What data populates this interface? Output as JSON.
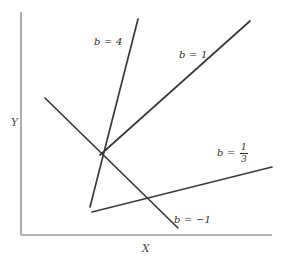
{
  "figure": {
    "background_color": "#ffffff",
    "line_color": "#3a3a3a",
    "axis_color": "#9a9a9a"
  },
  "axes": {
    "y_label": "Y",
    "x_label": "X",
    "y_axis": {
      "x": 21,
      "y_top": 12,
      "y_bottom": 235
    },
    "x_axis": {
      "y": 235,
      "x_left": 21,
      "x_right": 272
    }
  },
  "chart_data": {
    "type": "line",
    "title": "",
    "xlabel": "X",
    "ylabel": "Y",
    "grid": false,
    "legend": "inline-annotations",
    "fan_point": {
      "x": 100,
      "y": 155
    },
    "series": [
      {
        "name": "b = 4",
        "slope_label": "4",
        "annotation": "b = 4",
        "x1": 90,
        "y1": 207,
        "x2": 138,
        "y2": 19
      },
      {
        "name": "b = 1",
        "slope_label": "1",
        "annotation": "b = 1",
        "x1": 100,
        "y1": 155,
        "x2": 250,
        "y2": 21
      },
      {
        "name": "b = 1/3",
        "slope_label": "1/3",
        "annotation": "b = 1/3",
        "numerator": "1",
        "denominator": "3",
        "x1": 92,
        "y1": 212,
        "x2": 272,
        "y2": 167
      },
      {
        "name": "b = -1",
        "slope_label": "-1",
        "annotation": "b = −1",
        "x1": 45,
        "y1": 98,
        "x2": 178,
        "y2": 228
      }
    ]
  },
  "annotations": {
    "b4": {
      "prefix": "b",
      "equals": "=",
      "value": "4"
    },
    "b1": {
      "prefix": "b",
      "equals": "=",
      "value": "1"
    },
    "b13": {
      "prefix": "b",
      "equals": "=",
      "numerator": "1",
      "denominator": "3"
    },
    "bneg1": {
      "prefix": "b",
      "equals": "=",
      "value": "−1"
    }
  }
}
